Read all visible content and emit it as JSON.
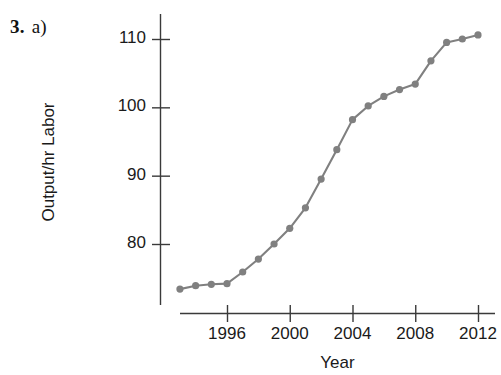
{
  "problem": {
    "number": "3.",
    "part": "a)"
  },
  "chart_data": {
    "type": "line",
    "title": "",
    "xlabel": "Year",
    "ylabel": "Output/hr Labor",
    "xlim": [
      1992.2,
      2012.8
    ],
    "ylim": [
      71.0,
      112.0
    ],
    "xticks": [
      1996,
      2000,
      2004,
      2008,
      2012
    ],
    "xtick_labels": [
      "1996",
      "2000",
      "2004",
      "2008",
      "2012"
    ],
    "yticks": [
      80,
      90,
      100,
      110
    ],
    "ytick_labels": [
      "80",
      "90",
      "100",
      "110"
    ],
    "grid": false,
    "legend": null,
    "series": [
      {
        "name": "Output per hour of labor",
        "color": "#808080",
        "marker": "circle",
        "x": [
          1993,
          1994,
          1995,
          1996,
          1997,
          1998,
          1999,
          2000,
          2001,
          2002,
          2003,
          2004,
          2005,
          2006,
          2007,
          2008,
          2009,
          2010,
          2011,
          2012
        ],
        "values": [
          73.4,
          73.9,
          74.1,
          74.2,
          75.9,
          77.8,
          80.0,
          82.3,
          85.3,
          89.5,
          93.8,
          98.2,
          100.2,
          101.6,
          102.6,
          103.4,
          106.8,
          109.5,
          110.0,
          110.6
        ]
      }
    ]
  },
  "colors": {
    "line": "#808080",
    "marker": "#808080",
    "axis": "#3a3a3a",
    "text": "#1a1a1a"
  }
}
